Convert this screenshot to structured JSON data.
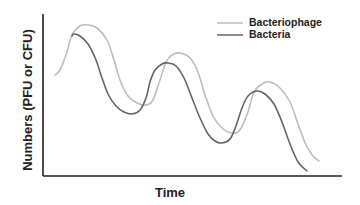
{
  "chart_data": {
    "type": "line",
    "title": "",
    "xlabel": "Time",
    "ylabel": "Numbers (PFU or CFU)",
    "grid": false,
    "legend_position": "top-right",
    "axis_ticks": false,
    "series": [
      {
        "name": "Bacteriophage",
        "color": "#bdbdbd",
        "points_px": [
          [
            55,
            75
          ],
          [
            60,
            70
          ],
          [
            66,
            55
          ],
          [
            72,
            35
          ],
          [
            80,
            26
          ],
          [
            88,
            25
          ],
          [
            97,
            28
          ],
          [
            107,
            40
          ],
          [
            114,
            60
          ],
          [
            120,
            80
          ],
          [
            128,
            96
          ],
          [
            137,
            103
          ],
          [
            146,
            105
          ],
          [
            153,
            100
          ],
          [
            160,
            80
          ],
          [
            166,
            62
          ],
          [
            172,
            55
          ],
          [
            180,
            53
          ],
          [
            190,
            58
          ],
          [
            198,
            72
          ],
          [
            205,
            95
          ],
          [
            213,
            116
          ],
          [
            222,
            128
          ],
          [
            232,
            133
          ],
          [
            240,
            130
          ],
          [
            248,
            112
          ],
          [
            254,
            92
          ],
          [
            262,
            84
          ],
          [
            270,
            82
          ],
          [
            280,
            88
          ],
          [
            290,
            102
          ],
          [
            298,
            124
          ],
          [
            306,
            145
          ],
          [
            313,
            156
          ],
          [
            319,
            161
          ]
        ],
        "description": "Oscillating curve lagging behind bacteria; peaks ~t=0.15, 0.46, 0.76"
      },
      {
        "name": "Bacteria",
        "color": "#666666",
        "points_px": [
          [
            72,
            36
          ],
          [
            74,
            34
          ],
          [
            80,
            36
          ],
          [
            88,
            44
          ],
          [
            96,
            60
          ],
          [
            102,
            78
          ],
          [
            108,
            94
          ],
          [
            116,
            106
          ],
          [
            124,
            112
          ],
          [
            132,
            114
          ],
          [
            140,
            110
          ],
          [
            146,
            98
          ],
          [
            150,
            82
          ],
          [
            155,
            70
          ],
          [
            162,
            64
          ],
          [
            168,
            63
          ],
          [
            176,
            66
          ],
          [
            184,
            78
          ],
          [
            192,
            98
          ],
          [
            200,
            118
          ],
          [
            208,
            134
          ],
          [
            215,
            141
          ],
          [
            222,
            143
          ],
          [
            230,
            139
          ],
          [
            236,
            126
          ],
          [
            242,
            108
          ],
          [
            248,
            96
          ],
          [
            257,
            91
          ],
          [
            265,
            94
          ],
          [
            274,
            104
          ],
          [
            282,
            122
          ],
          [
            290,
            144
          ],
          [
            298,
            162
          ],
          [
            307,
            171
          ]
        ],
        "description": "Oscillating curve leading phage; peaks ~t=0.10, 0.41, 0.72"
      }
    ],
    "relative_values": {
      "x": [
        0.0,
        0.1,
        0.2,
        0.3,
        0.4,
        0.5,
        0.6,
        0.7,
        0.8,
        0.9
      ],
      "Bacteria": [
        null,
        0.87,
        0.61,
        0.39,
        0.69,
        0.31,
        0.22,
        0.53,
        0.43,
        0.05
      ],
      "Bacteriophage": [
        0.62,
        0.88,
        0.78,
        0.45,
        0.69,
        0.74,
        0.28,
        0.59,
        0.68,
        0.28
      ]
    }
  },
  "legend": {
    "items": [
      {
        "label": "Bacteriophage",
        "color": "#bdbdbd"
      },
      {
        "label": "Bacteria",
        "color": "#666666"
      }
    ]
  },
  "axes": {
    "x_label": "Time",
    "y_label": "Numbers (PFU or CFU)"
  }
}
